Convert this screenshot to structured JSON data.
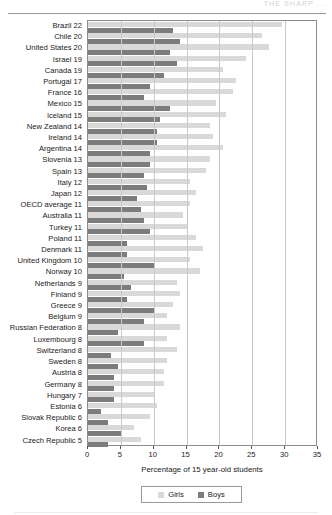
{
  "page": {
    "header_text": "THE SHARP ...",
    "background": "#ffffff"
  },
  "colors": {
    "girls": "#d9d9d9",
    "boys": "#7c7c7c",
    "grid": "#c9c9c9",
    "frame": "#8c8c8c",
    "text": "#1a1a1a"
  },
  "legend": {
    "position": "bottom-center",
    "entries": [
      {
        "label": "Girls",
        "color": "#d9d9d9",
        "icon": "legend-swatch-girls"
      },
      {
        "label": "Boys",
        "color": "#7c7c7c",
        "icon": "legend-swatch-boys"
      }
    ]
  },
  "chart_data": {
    "type": "bar",
    "orientation": "horizontal",
    "title": "",
    "subtitle": "",
    "xlabel": "Percentage of 15 year-old students",
    "ylabel": "",
    "xlim": [
      0,
      35
    ],
    "xticks": [
      0,
      5,
      10,
      15,
      20,
      25,
      30,
      35
    ],
    "xticklabels": [
      "0",
      "5",
      "10",
      "15",
      "20",
      "25",
      "30",
      "35"
    ],
    "grid": true,
    "grid_axis": "x",
    "legend_position": "bottom",
    "categories": [
      "Brazil 22",
      "Chile 20",
      "United States 20",
      "Israel 19",
      "Canada 19",
      "Portugal 17",
      "France 16",
      "Mexico 15",
      "Iceland 15",
      "New Zealand 14",
      "Ireland 14",
      "Argentina 14",
      "Slovenia 13",
      "Spain 13",
      "Italy 12",
      "Japan 12",
      "OECD average 11",
      "Australia 11",
      "Turkey 11",
      "Poland 11",
      "Denmark 11",
      "United Kingdom 10",
      "Norway 10",
      "Netherlands 9",
      "Finland 9",
      "Greece 9",
      "Belgium 9",
      "Russian Federation 8",
      "Luxembourg 8",
      "Switzerland 8",
      "Sweden 8",
      "Austria 8",
      "Germany 8",
      "Hungary 7",
      "Estonia 6",
      "Slovak Republic 6",
      "Korea 6",
      "Czech Republic 5"
    ],
    "series": [
      {
        "name": "Girls",
        "color": "#d9d9d9",
        "values": [
          29.5,
          26.5,
          27.5,
          24.0,
          20.5,
          22.5,
          22.0,
          19.5,
          21.0,
          18.5,
          19.0,
          20.5,
          18.5,
          18.0,
          15.5,
          16.5,
          15.5,
          14.5,
          15.0,
          16.5,
          17.5,
          15.5,
          17.0,
          13.5,
          14.0,
          13.0,
          12.0,
          14.0,
          12.0,
          13.5,
          12.0,
          11.5,
          11.5,
          10.0,
          10.5,
          9.5,
          7.0,
          8.0
        ]
      },
      {
        "name": "Boys",
        "color": "#7c7c7c",
        "values": [
          13.0,
          14.0,
          12.5,
          13.5,
          11.5,
          9.5,
          8.5,
          12.5,
          11.0,
          10.5,
          10.5,
          9.5,
          9.5,
          8.5,
          9.0,
          7.5,
          8.0,
          8.5,
          9.5,
          6.0,
          6.0,
          10.0,
          5.5,
          6.5,
          6.0,
          10.0,
          8.5,
          4.5,
          8.5,
          3.5,
          4.5,
          4.0,
          4.0,
          4.0,
          2.0,
          3.0,
          5.0,
          3.0
        ]
      }
    ]
  }
}
